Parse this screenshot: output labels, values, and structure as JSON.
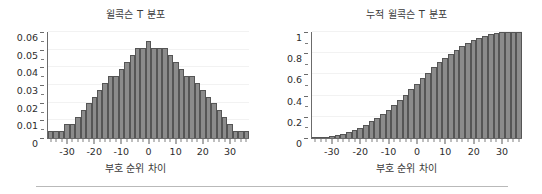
{
  "figure": {
    "background": "#ffffff",
    "bar_fill": "#8b8b8b",
    "bar_edge": "#555555",
    "axis_color": "#6b6b6b",
    "text_color": "#2d2d2d"
  },
  "footer": {
    "rule": ""
  },
  "chart_data": [
    {
      "type": "bar",
      "id": "wilcoxon-t-pdf",
      "title": "윌콕슨 T 분포",
      "xlabel": "부호 순위 차이",
      "ylabel": "",
      "xlim": [
        -37,
        37
      ],
      "ylim": [
        0,
        0.06
      ],
      "grid": true,
      "legend": null,
      "xticks": [
        -30,
        -20,
        -10,
        0,
        10,
        20,
        30
      ],
      "xtick_labels": [
        "-30",
        "-20",
        "-10",
        "0",
        "10",
        "20",
        "30"
      ],
      "yticks": [
        0,
        0.01,
        0.02,
        0.03,
        0.04,
        0.05,
        0.06
      ],
      "ytick_labels": [
        "0",
        "0.01",
        "0.02",
        "0.03",
        "0.04",
        "0.05",
        "0.06"
      ],
      "x": [
        -36,
        -34,
        -32,
        -30,
        -28,
        -26,
        -24,
        -22,
        -20,
        -18,
        -16,
        -14,
        -12,
        -10,
        -8,
        -6,
        -4,
        -2,
        0,
        2,
        4,
        6,
        8,
        10,
        12,
        14,
        16,
        18,
        20,
        22,
        24,
        26,
        28,
        30,
        32,
        34,
        36
      ],
      "categories": [
        "-36",
        "-34",
        "-32",
        "-30",
        "-28",
        "-26",
        "-24",
        "-22",
        "-20",
        "-18",
        "-16",
        "-14",
        "-12",
        "-10",
        "-8",
        "-6",
        "-4",
        "-2",
        "0",
        "2",
        "4",
        "6",
        "8",
        "10",
        "12",
        "14",
        "16",
        "18",
        "20",
        "22",
        "24",
        "26",
        "28",
        "30",
        "32",
        "34",
        "36"
      ],
      "values": [
        0.004,
        0.004,
        0.004,
        0.008,
        0.008,
        0.012,
        0.016,
        0.02,
        0.023,
        0.027,
        0.031,
        0.035,
        0.035,
        0.039,
        0.043,
        0.047,
        0.051,
        0.051,
        0.055,
        0.051,
        0.051,
        0.051,
        0.047,
        0.043,
        0.039,
        0.035,
        0.035,
        0.031,
        0.027,
        0.023,
        0.02,
        0.016,
        0.012,
        0.008,
        0.004,
        0.004,
        0.004
      ]
    },
    {
      "type": "bar",
      "id": "wilcoxon-t-cdf",
      "title": "누적 윌콕슨 T 분포",
      "xlabel": "부호 순위 차이",
      "ylabel": "",
      "xlim": [
        -37,
        37
      ],
      "ylim": [
        0,
        1
      ],
      "grid": true,
      "legend": null,
      "xticks": [
        -30,
        -20,
        -10,
        0,
        10,
        20,
        30
      ],
      "xtick_labels": [
        "-30",
        "-20",
        "-10",
        "0",
        "10",
        "20",
        "30"
      ],
      "yticks": [
        0,
        0.2,
        0.4,
        0.6,
        0.8,
        1
      ],
      "ytick_labels": [
        "0",
        "0.2",
        "0.4",
        "0.6",
        "0.8",
        "1"
      ],
      "x": [
        -36,
        -34,
        -32,
        -30,
        -28,
        -26,
        -24,
        -22,
        -20,
        -18,
        -16,
        -14,
        -12,
        -10,
        -8,
        -6,
        -4,
        -2,
        0,
        2,
        4,
        6,
        8,
        10,
        12,
        14,
        16,
        18,
        20,
        22,
        24,
        26,
        28,
        30,
        32,
        34,
        36
      ],
      "categories": [
        "-36",
        "-34",
        "-32",
        "-30",
        "-28",
        "-26",
        "-24",
        "-22",
        "-20",
        "-18",
        "-16",
        "-14",
        "-12",
        "-10",
        "-8",
        "-6",
        "-4",
        "-2",
        "0",
        "2",
        "4",
        "6",
        "8",
        "10",
        "12",
        "14",
        "16",
        "18",
        "20",
        "22",
        "24",
        "26",
        "28",
        "30",
        "32",
        "34",
        "36"
      ],
      "values": [
        0.004,
        0.008,
        0.012,
        0.02,
        0.028,
        0.04,
        0.056,
        0.076,
        0.099,
        0.126,
        0.157,
        0.192,
        0.227,
        0.266,
        0.309,
        0.356,
        0.407,
        0.458,
        0.513,
        0.564,
        0.615,
        0.666,
        0.713,
        0.756,
        0.795,
        0.83,
        0.865,
        0.896,
        0.923,
        0.946,
        0.966,
        0.982,
        0.994,
        1.0,
        1.0,
        1.0,
        1.0
      ]
    }
  ]
}
